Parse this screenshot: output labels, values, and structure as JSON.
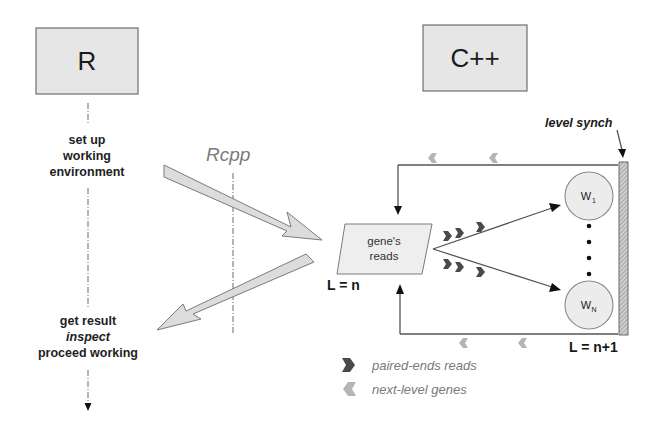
{
  "diagram": {
    "left_column": {
      "title": "R",
      "step1": [
        "set up",
        "working",
        "environment"
      ],
      "step2": [
        "get result",
        "inspect",
        "proceed working"
      ]
    },
    "bridge": {
      "label": "Rcpp"
    },
    "right_column": {
      "title": "C++",
      "gene_box": [
        "gene's",
        "reads"
      ],
      "level_in": "L = n",
      "level_out": "L = n+1",
      "synch_label": "level synch",
      "workers": [
        {
          "name": "W",
          "sub": "1"
        },
        {
          "name": "W",
          "sub": "N"
        }
      ]
    },
    "legend": [
      {
        "icon": "chevron-right-icon",
        "label": "paired-ends reads",
        "color": "#4a4a4a"
      },
      {
        "icon": "chevron-left-icon",
        "label": "next-level genes",
        "color": "#b5b5b5"
      }
    ],
    "colors": {
      "box_fill": "#e6e6e6",
      "arrow_fill": "#dcdcdc",
      "dark_chevron": "#4a4a4a",
      "light_chevron": "#b5b5b5"
    }
  }
}
